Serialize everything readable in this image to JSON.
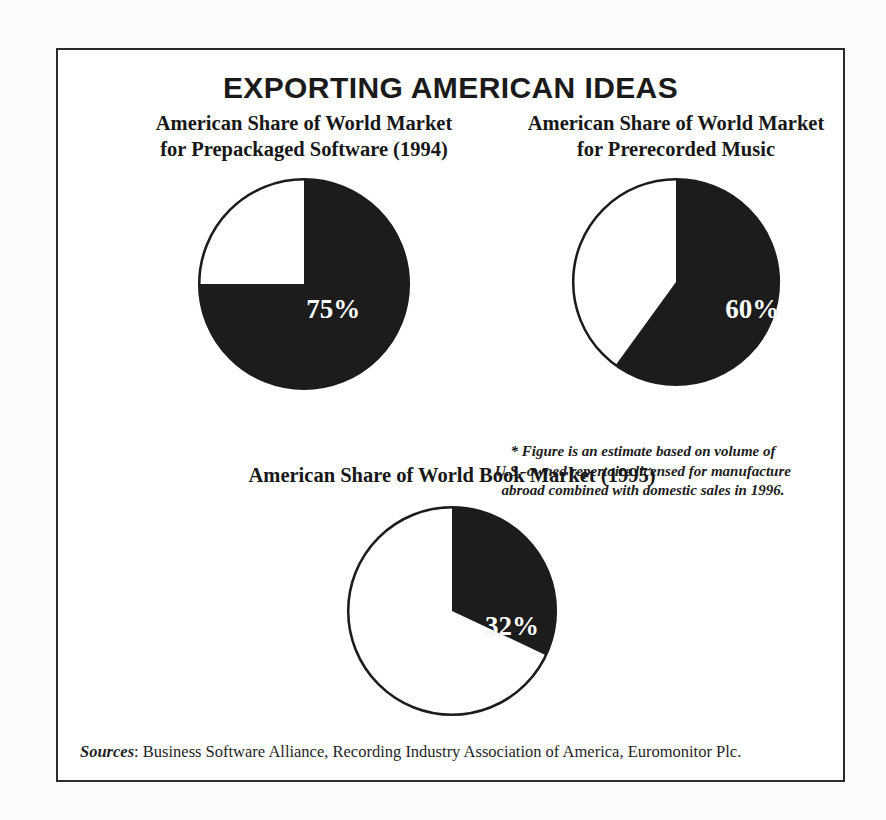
{
  "headline": "EXPORTING AMERICAN IDEAS",
  "charts": [
    {
      "id": "software",
      "title": "American Share of World Market\nfor Prepackaged Software (1994)",
      "label": "75%",
      "value": 75
    },
    {
      "id": "music",
      "title": "American Share of World Market\nfor Prerecorded Music",
      "label": "60%",
      "value": 60
    },
    {
      "id": "books",
      "title": "American Share of World Book Market (1995)",
      "label": "32%",
      "value": 32
    }
  ],
  "footnote": "* Figure is an estimate based on volume of\nU.S.-owned repertoire licensed for manufacture\nabroad combined with domestic sales in 1996.",
  "sources": {
    "label": "Sources",
    "text": ": Business Software Alliance, Recording Industry Association of America, Euromonitor Plc."
  },
  "colors": {
    "slice_fill": "#1c1c1c",
    "remainder_fill": "#ffffff",
    "outline": "#1c1c1c",
    "frame": "#2b2b2b",
    "label_text": "#ffffff"
  },
  "chart_data": [
    {
      "type": "pie",
      "title": "American Share of World Market for Prepackaged Software (1994)",
      "categories": [
        "American share",
        "Rest of world"
      ],
      "values": [
        75,
        25
      ],
      "unit": "percent",
      "data_labels": [
        "75%",
        ""
      ],
      "start_angle_deg": 0,
      "direction": "clockwise",
      "legend": "none"
    },
    {
      "type": "pie",
      "title": "American Share of World Market for Prerecorded Music",
      "categories": [
        "American share",
        "Rest of world"
      ],
      "values": [
        60,
        40
      ],
      "unit": "percent",
      "data_labels": [
        "60%",
        ""
      ],
      "start_angle_deg": 0,
      "direction": "clockwise",
      "legend": "none",
      "annotation": "* Figure is an estimate based on volume of U.S.-owned repertoire licensed for manufacture abroad combined with domestic sales in 1996."
    },
    {
      "type": "pie",
      "title": "American Share of World Book Market (1995)",
      "categories": [
        "American share",
        "Rest of world"
      ],
      "values": [
        32,
        68
      ],
      "unit": "percent",
      "data_labels": [
        "32%",
        ""
      ],
      "start_angle_deg": 0,
      "direction": "clockwise",
      "legend": "none"
    }
  ]
}
